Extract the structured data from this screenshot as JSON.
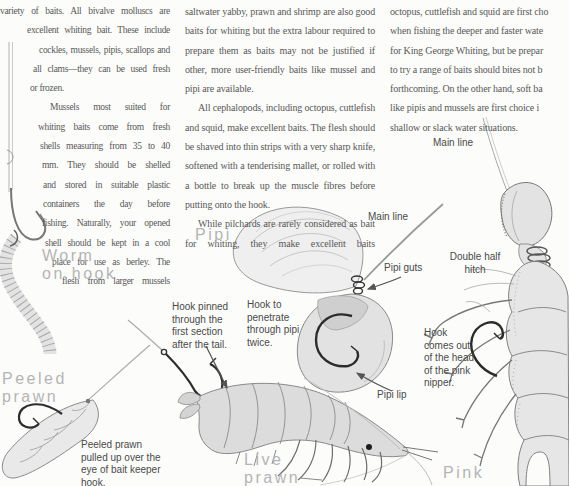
{
  "colors": {
    "background": "#fcfcfb",
    "body_text": "#585858",
    "heading_text": "#b4b4b4",
    "caption_text": "#4a4a4a",
    "sketch_stroke": "#888888",
    "sketch_fill": "#e7e7e7",
    "hook_dark": "#2e2e2e"
  },
  "article": {
    "col1_lines": [
      {
        "text": "variety of baits. All bivalve molluscs are",
        "indent": 0
      },
      {
        "text": "excellent whiting bait. These include",
        "indent": 27
      },
      {
        "text": "cockles, mussels, pipis, scallops and",
        "indent": 39
      },
      {
        "text": "all clams—they can be used fresh",
        "indent": 33
      },
      {
        "text": "or frozen.",
        "indent": 30,
        "last": true
      },
      {
        "text": "Mussels most suited for",
        "indent": 50
      },
      {
        "text": "whiting baits come from fresh",
        "indent": 38
      },
      {
        "text": "shells measuring from 35 to 40",
        "indent": 40
      },
      {
        "text": "mm. They should be shelled",
        "indent": 42
      },
      {
        "text": "and stored in suitable plastic",
        "indent": 43
      },
      {
        "text": "containers the day before",
        "indent": 43
      },
      {
        "text": "fishing. Naturally, your opened",
        "indent": 42
      },
      {
        "text": "shell should be kept in a cool",
        "indent": 45
      },
      {
        "text": "place for use as berley. The",
        "indent": 52
      },
      {
        "text": "flesh from larger mussels",
        "indent": 62
      }
    ],
    "col2_paragraphs": [
      {
        "text": "saltwater yabby, prawn and shrimp are also good baits for whiting but the extra labour required to prepare them as baits may not be justified if other, more user-friendly baits like mussel and pipi are available.",
        "ind": false,
        "cont": false
      },
      {
        "text": "All cephalopods, including octopus, cuttlefish and squid, make excellent baits. The flesh should be shaved into thin strips with a very sharp knife, softened with a tenderising mallet, or rolled with a bottle to break up the muscle fibres before putting onto the hook.",
        "ind": true,
        "cont": false
      },
      {
        "text": "While pilchards are rarely considered as bait for whiting, they make excellent baits",
        "ind": true,
        "cont": true
      }
    ],
    "col3_lines": [
      "octopus, cuttlefish and squid are first cho",
      "when fishing the deeper and faster wate",
      "for King George Whiting, but be prepar",
      "to try a range of baits should bites not b",
      "forthcoming. On the other hand, soft ba",
      "like pipis and mussels are first choice i",
      "shallow or slack water situations."
    ]
  },
  "figures": {
    "worm": {
      "title_lines": [
        "Worm",
        "on hook"
      ]
    },
    "pipi": {
      "title": "Pipi",
      "main_line_label": "Main line",
      "guts_label": "Pipi guts",
      "lip_label": "Pipi lip",
      "hook_caption_lines": [
        "Hook to",
        "penetrate",
        "through pipi",
        "twice."
      ]
    },
    "peeled_prawn": {
      "title_lines": [
        "Peeled",
        "prawn"
      ],
      "caption_lines": [
        "Peeled prawn",
        "pulled up over the",
        "eye of bait keeper",
        "hook."
      ]
    },
    "live_prawn": {
      "title_lines": [
        "Live",
        "prawn"
      ],
      "hook_caption_lines": [
        "Hook pinned",
        "through the",
        "first section",
        "after the tail."
      ]
    },
    "pink_nipper": {
      "title": "Pink",
      "main_line_label": "Main line",
      "knot_caption_lines": [
        "Double half",
        "hitch"
      ],
      "hook_caption_lines": [
        "Hook",
        "comes out",
        "of the head",
        "of the pink",
        "nipper."
      ]
    }
  }
}
